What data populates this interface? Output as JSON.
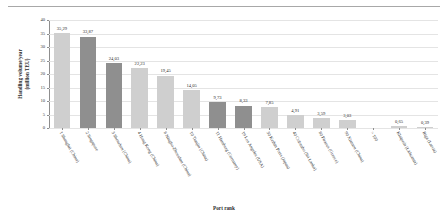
{
  "chart_data": {
    "type": "bar",
    "title": "",
    "xlabel": "Port rank",
    "ylabel": "Handling volume/year (million TEU)",
    "ylabel_line1": "Handling volume/year",
    "ylabel_line2": "(million TEU)",
    "ylim": [
      0,
      40
    ],
    "yticks": [
      0,
      5,
      10,
      15,
      20,
      25,
      30,
      35,
      40
    ],
    "ytick_labels": [
      "0",
      "5",
      "10",
      "15",
      "20",
      "25",
      "30",
      "35",
      "40"
    ],
    "grid": true,
    "legend": "none",
    "decimal_separator": ",",
    "categories": [
      "1 Shanghai (China)",
      "2 Singapore",
      "3 Shenzhen (China)",
      "4 Hong Kong (China)",
      "8 Ningbo-Zhoushan (China)",
      "10 Tianjin (China)",
      "11 Hamburg (Germany)",
      "19 Los Angeles (USA)",
      "30 Keihin Ports (Japan)",
      "40 Colombo (Sri Lanka)",
      "80 Piraeus (Greece)",
      "90 Xiamen (China)",
      "> 100",
      "Klaipeda (Lithuania)",
      "Riga (Latvia)"
    ],
    "values": [
      35.29,
      33.87,
      24.03,
      22.23,
      19.45,
      14.05,
      9.73,
      8.33,
      7.85,
      4.91,
      3.59,
      3.03,
      null,
      0.65,
      0.39
    ],
    "value_labels": [
      "35,29",
      "33,87",
      "24,03",
      "22,23",
      "19,45",
      "14,05",
      "9,73",
      "8,33",
      "7,85",
      "4,91",
      "3,59",
      "3,03",
      "",
      "0,65",
      "0,39"
    ],
    "bar_shades": [
      "light",
      "dark",
      "dark",
      "light",
      "light",
      "light",
      "dark",
      "dark",
      "light",
      "light",
      "light",
      "light",
      "none",
      "light",
      "light"
    ],
    "colors": {
      "bar_light": "#cfcfcf",
      "bar_dark": "#8f8f8f",
      "grid": "#e4e4e4",
      "axis": "#8e8e8e",
      "text": "#2b2b2b"
    }
  }
}
